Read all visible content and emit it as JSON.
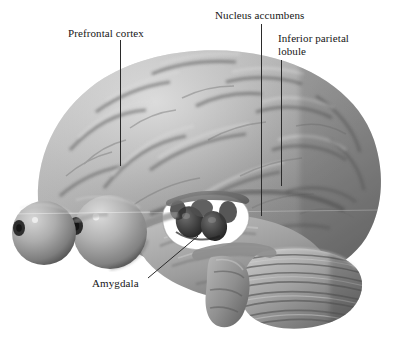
{
  "figure": {
    "kind": "anatomical-illustration",
    "background_color": "#ffffff",
    "render_style": "grayscale 3D shaded render",
    "label_color": "#161616",
    "leader_line_color": "#2b2b2b"
  },
  "labels": [
    {
      "id": "prefrontal-cortex",
      "text": "Prefrontal cortex"
    },
    {
      "id": "nucleus-accumbens",
      "text": "Nucleus accumbens"
    },
    {
      "id": "inferior-parietal-lobule",
      "text": "Inferior parietal\nlobule"
    },
    {
      "id": "amygdala",
      "text": "Amygdala"
    }
  ],
  "leaders": [
    {
      "id": "leader-prefrontal-cortex",
      "x1": 120,
      "y1": 40,
      "x2": 120,
      "y2": 166
    },
    {
      "id": "leader-nucleus-accumbens",
      "x1": 261,
      "y1": 24,
      "x2": 261,
      "y2": 216
    },
    {
      "id": "leader-inferior-parietal-lobule",
      "x1": 281,
      "y1": 60,
      "x2": 281,
      "y2": 186
    },
    {
      "id": "leader-amygdala",
      "x1": 148,
      "y1": 278,
      "x2": 198,
      "y2": 236
    }
  ],
  "anatomy": {
    "cerebrum": "cortical surface with gyri and sulci",
    "eyes": [
      "left-eyeball",
      "right-eyeball"
    ],
    "cerebellum": "foliated striped structure posterior-inferior",
    "brainstem": "descending from midbrain",
    "subcortical_window": "cut-away revealing dark deep nuclei"
  }
}
